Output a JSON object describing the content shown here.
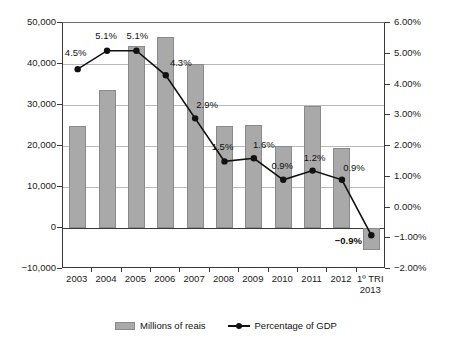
{
  "chart_data": {
    "type": "bar",
    "title": "",
    "subtitle": "",
    "xlabel": "",
    "ylabel": "",
    "grid": true,
    "legend_position": "bottom",
    "categories": [
      "2003",
      "2004",
      "2005",
      "2006",
      "2007",
      "2008",
      "2009",
      "2010",
      "2011",
      "2012",
      "1º TRI\n2013"
    ],
    "series": [
      {
        "name": "Millions of reais",
        "type": "bar",
        "axis": "left",
        "color": "#a9a9a9",
        "values": [
          24800,
          33700,
          44300,
          46500,
          39900,
          24900,
          25200,
          20000,
          29700,
          19400,
          -5400
        ]
      },
      {
        "name": "Percentage of GDP",
        "type": "line",
        "axis": "right",
        "color": "#111111",
        "values": [
          4.5,
          5.1,
          5.1,
          4.3,
          2.9,
          1.5,
          1.6,
          0.9,
          1.2,
          0.9,
          -0.9
        ],
        "labels": [
          "4.5%",
          "5.1%",
          "5.1%",
          "4.3%",
          "2.9%",
          "1.5%",
          "1.6%",
          "0.9%",
          "1.2%",
          "0.9%",
          "−0.9%"
        ]
      }
    ],
    "left_axis": {
      "ticks": [
        50000,
        40000,
        30000,
        20000,
        10000,
        0,
        -10000
      ],
      "tick_labels": [
        "50,000",
        "40,000",
        "30,000",
        "20,000",
        "10,000",
        "0",
        "−10,000"
      ],
      "min": -10000,
      "max": 50000
    },
    "right_axis": {
      "ticks": [
        6,
        5,
        4,
        3,
        2,
        1,
        0,
        -1,
        -2
      ],
      "tick_labels": [
        "6.00%",
        "5.00%",
        "4.00%",
        "3.00%",
        "2.00%",
        "1.00%",
        "0.00%",
        "−1.00%",
        "−2.00%"
      ],
      "min": -2,
      "max": 6
    }
  },
  "legend": {
    "entries": [
      {
        "label": "Millions of reais",
        "marker": "bar-swatch-icon"
      },
      {
        "label": "Percentage of GDP",
        "marker": "line-marker-icon"
      }
    ]
  }
}
